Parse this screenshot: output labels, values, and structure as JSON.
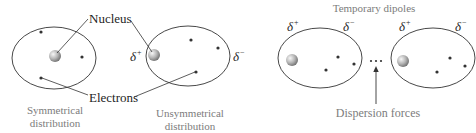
{
  "diagram": {
    "left_panel": {
      "labels": {
        "nucleus": "Nucleus",
        "electrons": "Electrons"
      },
      "atoms": [
        {
          "caption_line1": "Symmetrical",
          "caption_line2": "distribution",
          "charges": null
        },
        {
          "caption_line1": "Unsymmetrical",
          "caption_line2": "distribution",
          "charges": {
            "positive": "δ",
            "positive_sup": "+",
            "negative": "δ",
            "negative_sup": "−"
          }
        }
      ]
    },
    "right_panel": {
      "title": "Temporary dipoles",
      "dots": "• • •",
      "arrow_label": "Dispersion forces",
      "atoms": [
        {
          "charges": {
            "positive": "δ",
            "positive_sup": "+",
            "negative": "δ",
            "negative_sup": "−"
          }
        },
        {
          "charges": {
            "positive": "δ",
            "positive_sup": "+",
            "negative": "δ",
            "negative_sup": "−"
          }
        }
      ]
    },
    "colors": {
      "outline": "#333333",
      "caption_text": "#7c7c7c",
      "nucleus_light": "#f2f2f2",
      "nucleus_dark": "#7a7a7a"
    }
  }
}
